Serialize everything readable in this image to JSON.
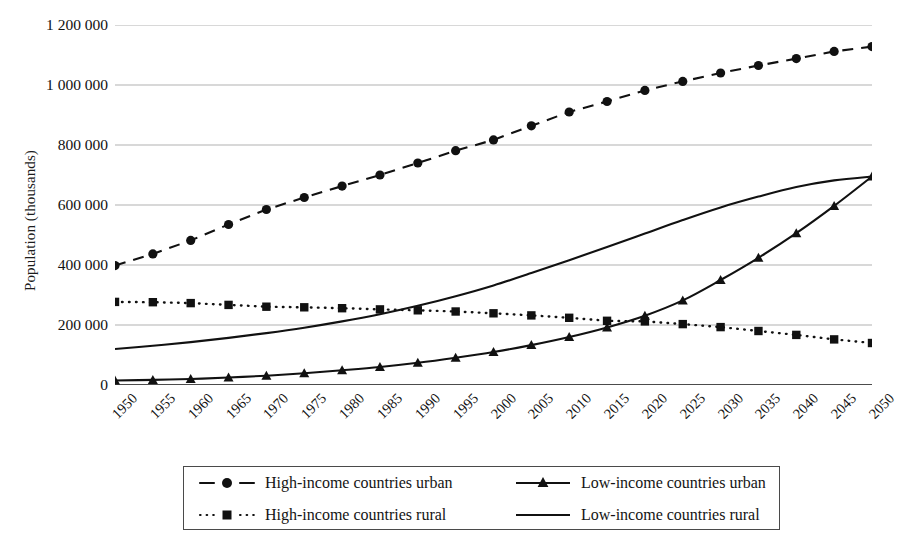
{
  "chart_data": {
    "type": "line",
    "title": "",
    "xlabel": "",
    "ylabel": "Population (thousands)",
    "x": [
      1950,
      1955,
      1960,
      1965,
      1970,
      1975,
      1980,
      1985,
      1990,
      1995,
      2000,
      2005,
      2010,
      2015,
      2020,
      2025,
      2030,
      2035,
      2040,
      2045,
      2050
    ],
    "categories": [
      "1950",
      "1955",
      "1960",
      "1965",
      "1970",
      "1975",
      "1980",
      "1985",
      "1990",
      "1995",
      "2000",
      "2005",
      "2010",
      "2015",
      "2020",
      "2025",
      "2030",
      "2035",
      "2040",
      "2045",
      "2050"
    ],
    "xlim": [
      1950,
      2050
    ],
    "ylim": [
      0,
      1200000
    ],
    "yticks": [
      0,
      200000,
      400000,
      600000,
      800000,
      1000000,
      1200000
    ],
    "ytick_labels": [
      "0",
      "200 000",
      "400 000",
      "600 000",
      "800 000",
      "1 000 000",
      "1 200 000"
    ],
    "grid": "horizontal",
    "legend_position": "bottom",
    "series": [
      {
        "name": "High-income countries urban",
        "marker": "circle",
        "line_style": "dashed",
        "color": "#111111",
        "values": [
          398000,
          437000,
          482000,
          535000,
          585000,
          625000,
          663000,
          700000,
          740000,
          781000,
          817000,
          864000,
          910000,
          945000,
          982000,
          1012000,
          1040000,
          1065000,
          1088000,
          1112000,
          1128000
        ]
      },
      {
        "name": "High-income countries rural",
        "marker": "square",
        "line_style": "dotted",
        "color": "#111111",
        "values": [
          277000,
          276000,
          273000,
          267000,
          261000,
          259000,
          256000,
          252000,
          249000,
          245000,
          239000,
          232000,
          224000,
          214000,
          212000,
          203000,
          193000,
          180000,
          167000,
          152000,
          140000
        ]
      },
      {
        "name": "Low-income countries urban",
        "marker": "triangle",
        "line_style": "solid",
        "color": "#111111",
        "values": [
          15000,
          17000,
          20000,
          25000,
          31000,
          39000,
          49000,
          60000,
          74000,
          91000,
          110000,
          133000,
          160000,
          192000,
          231000,
          282000,
          350000,
          424000,
          506000,
          597000,
          695000
        ]
      },
      {
        "name": "Low-income countries rural",
        "marker": "none",
        "line_style": "solid",
        "color": "#111111",
        "values": [
          120000,
          131000,
          143000,
          157000,
          173000,
          191000,
          212000,
          236000,
          264000,
          296000,
          332000,
          373000,
          416000,
          460000,
          505000,
          550000,
          592000,
          628000,
          660000,
          682000,
          695000
        ]
      }
    ]
  },
  "legend": {
    "items": [
      {
        "label": "High-income countries urban",
        "sample": "dashed-circle"
      },
      {
        "label": "Low-income countries urban",
        "sample": "solid-triangle"
      },
      {
        "label": "High-income countries rural",
        "sample": "dotted-square"
      },
      {
        "label": "Low-income countries rural",
        "sample": "solid-plain"
      }
    ]
  }
}
